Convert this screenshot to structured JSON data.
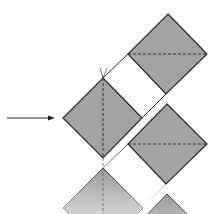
{
  "diagram": {
    "colors": {
      "fill": "#a3a3a3",
      "stroke": "#2a2a2a",
      "background": "#ffffff"
    },
    "shapes": [
      {
        "id": "upper-right-square",
        "type": "diamond",
        "fold_line": "horizontal-dashed"
      },
      {
        "id": "left-square",
        "type": "diamond",
        "fold_line": "vertical-dashed",
        "mark": "fold-tick"
      },
      {
        "id": "lower-right-square",
        "type": "diamond",
        "fold_line": "horizontal-dashed"
      },
      {
        "id": "bottom-left-square-faded",
        "type": "diamond-faded",
        "fold_line": "vertical-dashed"
      },
      {
        "id": "bottom-right-square-faded",
        "type": "diamond-faded"
      }
    ],
    "connectors": [
      "white-strip-upper",
      "white-strip-lower"
    ],
    "arrow": {
      "direction": "right",
      "icon": "arrow-right-icon"
    }
  }
}
